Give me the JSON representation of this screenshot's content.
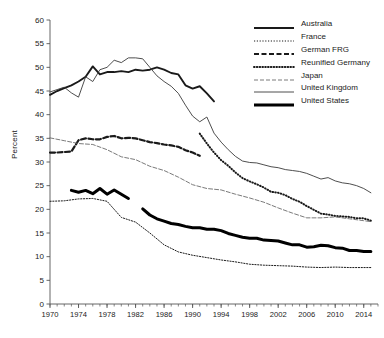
{
  "chart_data": {
    "type": "line",
    "title": "",
    "xlabel": "",
    "ylabel": "Percent",
    "xlim": [
      1970,
      2016
    ],
    "ylim": [
      0,
      60
    ],
    "ytick_step": 5,
    "yticks": [
      0,
      5,
      10,
      15,
      20,
      25,
      30,
      35,
      40,
      45,
      50,
      55,
      60
    ],
    "xticks": [
      1970,
      1974,
      1978,
      1982,
      1986,
      1990,
      1994,
      1998,
      2002,
      2006,
      2010,
      2014
    ],
    "xtick_minor_step": 1,
    "grid": false,
    "legend_position": "top-right",
    "series": [
      {
        "name": "Australia",
        "style": "solid-thick",
        "color": "#1a1a1a",
        "x": [
          1970,
          1971,
          1972,
          1973,
          1974,
          1975,
          1976,
          1977,
          1978,
          1979,
          1980,
          1981,
          1982,
          1983,
          1984,
          1985,
          1986,
          1987,
          1988,
          1989,
          1990,
          1991,
          1992,
          1993
        ],
        "values": [
          44.2,
          45.0,
          45.6,
          46.2,
          47.0,
          48.0,
          50.2,
          48.5,
          49.0,
          49.0,
          49.2,
          49.0,
          49.5,
          49.3,
          49.5,
          50.0,
          49.5,
          48.8,
          48.5,
          46.2,
          45.5,
          46.0,
          44.5,
          42.8
        ]
      },
      {
        "name": "France",
        "style": "dotted-fine",
        "color": "#1a1a1a",
        "x": [
          1970,
          1972,
          1974,
          1976,
          1978,
          1980,
          1982,
          1984,
          1986,
          1988,
          1990,
          1992,
          1994,
          1996,
          1998,
          2000,
          2002,
          2004,
          2006,
          2008,
          2010,
          2012,
          2014,
          2015
        ],
        "values": [
          21.7,
          21.8,
          22.2,
          22.3,
          21.7,
          18.3,
          17.3,
          15.0,
          12.5,
          11.0,
          10.3,
          9.8,
          9.3,
          8.9,
          8.4,
          8.2,
          8.1,
          8.0,
          7.8,
          7.7,
          7.8,
          7.7,
          7.7,
          7.7
        ]
      },
      {
        "name": "German FRG",
        "style": "dashed-thick",
        "color": "#1a1a1a",
        "x": [
          1970,
          1971,
          1972,
          1973,
          1974,
          1975,
          1976,
          1977,
          1978,
          1979,
          1980,
          1981,
          1982,
          1983,
          1984,
          1985,
          1986,
          1987,
          1988,
          1989,
          1990,
          1991
        ],
        "values": [
          32.0,
          32.0,
          32.1,
          32.2,
          34.6,
          35.0,
          34.8,
          34.8,
          35.3,
          35.5,
          35.0,
          35.1,
          35.0,
          34.6,
          34.2,
          34.0,
          33.7,
          33.5,
          33.2,
          32.5,
          32.0,
          31.3
        ]
      },
      {
        "name": "Reunified Germany",
        "style": "dotted-thick",
        "color": "#1a1a1a",
        "x": [
          1991,
          1992,
          1993,
          1994,
          1995,
          1996,
          1997,
          1998,
          1999,
          2000,
          2001,
          2002,
          2003,
          2004,
          2005,
          2006,
          2007,
          2008,
          2009,
          2010,
          2011,
          2012,
          2013,
          2014,
          2015
        ],
        "values": [
          36.0,
          33.9,
          32.0,
          30.4,
          29.2,
          27.8,
          26.6,
          25.9,
          25.3,
          24.6,
          23.7,
          23.5,
          23.0,
          22.2,
          21.6,
          20.7,
          19.9,
          19.1,
          18.9,
          18.6,
          18.5,
          18.4,
          18.1,
          18.1,
          17.6
        ]
      },
      {
        "name": "Japan",
        "style": "dashed-fine",
        "color": "#6b6b6b",
        "x": [
          1970,
          1972,
          1974,
          1976,
          1978,
          1980,
          1982,
          1984,
          1986,
          1988,
          1990,
          1992,
          1994,
          1996,
          1998,
          2000,
          2002,
          2004,
          2006,
          2008,
          2010,
          2012,
          2014,
          2015
        ],
        "values": [
          35.1,
          34.5,
          33.9,
          33.7,
          32.6,
          31.1,
          30.5,
          29.1,
          28.2,
          26.8,
          25.2,
          24.4,
          24.1,
          23.2,
          22.4,
          21.5,
          20.3,
          19.2,
          18.2,
          18.2,
          18.4,
          18.0,
          17.6,
          17.4
        ]
      },
      {
        "name": "United Kingdom",
        "style": "solid-thin",
        "color": "#3a3a3a",
        "x": [
          1970,
          1971,
          1972,
          1973,
          1974,
          1975,
          1976,
          1977,
          1978,
          1979,
          1980,
          1981,
          1982,
          1983,
          1984,
          1985,
          1986,
          1987,
          1988,
          1989,
          1990,
          1991,
          1992,
          1993,
          1994,
          1995,
          1996,
          1997,
          1998,
          1999,
          2000,
          2001,
          2002,
          2003,
          2004,
          2005,
          2006,
          2007,
          2008,
          2009,
          2010,
          2011,
          2012,
          2013,
          2014,
          2015
        ],
        "values": [
          44.8,
          45.3,
          45.8,
          44.6,
          43.7,
          48.0,
          47.0,
          49.5,
          50.0,
          51.5,
          51.0,
          52.0,
          52.0,
          51.8,
          50.0,
          48.2,
          47.0,
          46.0,
          44.5,
          42.0,
          39.7,
          38.5,
          39.5,
          36.1,
          34.2,
          32.6,
          31.2,
          30.2,
          29.9,
          29.8,
          29.4,
          29.0,
          28.8,
          28.4,
          28.2,
          28.0,
          27.6,
          27.0,
          26.4,
          26.7,
          26.0,
          25.6,
          25.4,
          25.0,
          24.4,
          23.5
        ]
      },
      {
        "name": "United States",
        "style": "solid-extrathick",
        "color": "#000000",
        "segments": [
          {
            "x": [
              1973,
              1974,
              1975,
              1976,
              1977,
              1978,
              1979,
              1980,
              1981
            ],
            "values": [
              24.0,
              23.6,
              24.0,
              23.3,
              24.4,
              23.2,
              24.1,
              23.2,
              22.3
            ]
          },
          {
            "x": [
              1983,
              1984,
              1985,
              1986,
              1987,
              1988,
              1989,
              1990,
              1991,
              1992,
              1993,
              1994,
              1995,
              1996,
              1997,
              1998,
              1999,
              2000,
              2001,
              2002,
              2003,
              2004,
              2005,
              2006,
              2007,
              2008,
              2009,
              2010,
              2011,
              2012,
              2013,
              2014,
              2015
            ],
            "values": [
              20.1,
              18.8,
              18.0,
              17.5,
              17.0,
              16.8,
              16.4,
              16.1,
              16.1,
              15.8,
              15.8,
              15.5,
              14.9,
              14.5,
              14.1,
              13.9,
              13.9,
              13.5,
              13.4,
              13.3,
              12.9,
              12.5,
              12.5,
              12.0,
              12.1,
              12.4,
              12.3,
              11.9,
              11.8,
              11.3,
              11.3,
              11.1,
              11.1
            ]
          }
        ]
      }
    ]
  },
  "legend": {
    "items": [
      {
        "label": "Australia",
        "style": "solid-thick"
      },
      {
        "label": "France",
        "style": "dotted-fine"
      },
      {
        "label": "German FRG",
        "style": "dashed-thick"
      },
      {
        "label": "Reunified Germany",
        "style": "dotted-thick"
      },
      {
        "label": "Japan",
        "style": "dashed-fine"
      },
      {
        "label": "United Kingdom",
        "style": "solid-thin"
      },
      {
        "label": "United States",
        "style": "solid-extrathick"
      }
    ]
  },
  "axis": {
    "y_title": "Percent",
    "y_ticks": [
      "60",
      "55",
      "50",
      "45",
      "40",
      "35",
      "30",
      "25",
      "20",
      "15",
      "10",
      "5",
      "0"
    ],
    "x_ticks": [
      "1970",
      "1974",
      "1978",
      "1982",
      "1986",
      "1990",
      "1994",
      "1998",
      "2002",
      "2006",
      "2010",
      "2014"
    ]
  }
}
